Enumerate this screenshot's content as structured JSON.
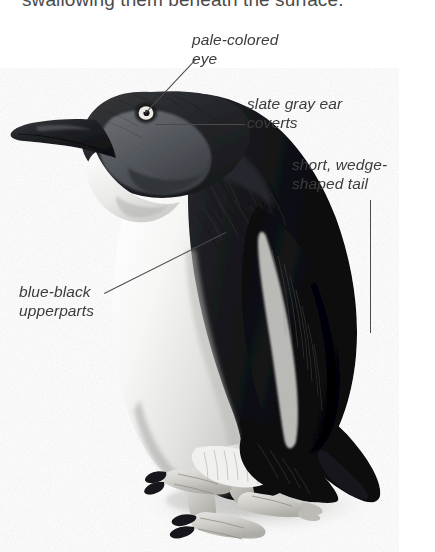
{
  "page": {
    "background_color": "#ffffff",
    "width": 435,
    "height": 552
  },
  "caption": {
    "text": "swallowing them beneath the surface."
  },
  "illustration": {
    "subject": "little-penguin",
    "description": "Side view photographic illustration of a Little (Blue) Penguin standing upright, facing left, with dark blue-black upperparts and white underparts.",
    "ink_color": "#4a4a4a",
    "dark_plumage_color": "#121212",
    "mid_plumage_color": "#4f5257",
    "pale_plumage_color": "#f2f2f0",
    "shadow_color": "#d8d8d6",
    "eye_iris_color": "#e8e8e4",
    "eye_pupil_color": "#1a1a1a"
  },
  "annotations": [
    {
      "id": "pale-colored-eye",
      "text": "pale-colored\neye",
      "target": "eye"
    },
    {
      "id": "slate-gray-ear-coverts",
      "text": "slate gray ear\ncoverts",
      "target": "ear-coverts"
    },
    {
      "id": "short-wedge-shaped-tail",
      "text": "short, wedge-\nshaped tail",
      "target": "tail"
    },
    {
      "id": "blue-black-upperparts",
      "text": "blue-black\nupperparts",
      "target": "upperparts"
    }
  ]
}
